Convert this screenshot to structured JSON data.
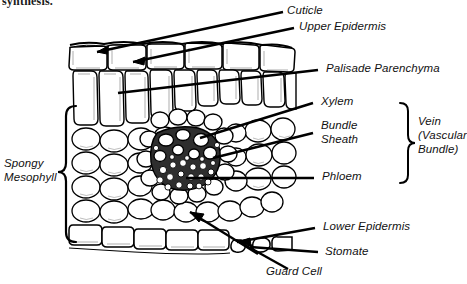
{
  "figure": {
    "kind": "leaf-cross-section-diagram",
    "cutoff_text": "synthesis.",
    "ink_color": "#000000",
    "cell_fill": "#ffffff",
    "shade_color": "#cfcfcf"
  },
  "labels": {
    "cuticle": "Cuticle",
    "upper_epidermis": "Upper Epidermis",
    "palisade_parenchyma": "Palisade Parenchyma",
    "xylem": "Xylem",
    "bundle_sheath": "Bundle\nSheath",
    "phloem": "Phloem",
    "lower_epidermis": "Lower Epidermis",
    "stomate": "Stomate",
    "guard_cell": "Guard Cell",
    "spongy_mesophyll": "Spongy\nMesophyll",
    "vein": "Vein\n(Vascular\nBundle)"
  },
  "braces": {
    "left_label": "spongy-mesophyll-brace",
    "right_label": "vein-brace"
  }
}
